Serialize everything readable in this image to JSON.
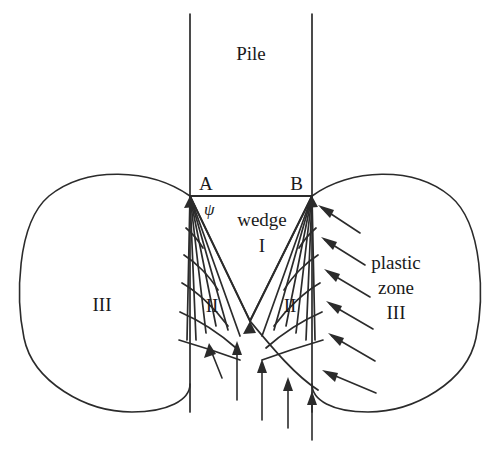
{
  "figure": {
    "type": "geotechnical-failure-mechanism-diagram",
    "background_color": "#ffffff",
    "line_color": "#2b2b2b",
    "text_color": "#1a1a1a"
  },
  "labels": {
    "pile": "Pile",
    "point_a": "A",
    "point_b": "B",
    "psi": "ψ",
    "wedge_word": "wedge",
    "wedge_numeral": "I",
    "zone_two_left": "II",
    "zone_two_right": "II",
    "zone_three_left": "III",
    "plastic_line1": "plastic",
    "plastic_line2": "zone",
    "plastic_line3": "III"
  },
  "geometry": {
    "pile_left_x": 190,
    "pile_right_x": 312,
    "pile_top_y": 14,
    "pile_bottom_y": 412,
    "point_a": [
      190,
      196
    ],
    "point_b": [
      312,
      196
    ],
    "wedge_apex": [
      250,
      321
    ],
    "left_lobe_left_x": 24,
    "right_lobe_right_x": 476,
    "lobe_top_y": 172,
    "lobe_bottom_y": 412,
    "fan_radial_count": 7,
    "spiral_arc_count": 5,
    "right_arrow_count": 6,
    "bottom_arrow_count": 4
  }
}
